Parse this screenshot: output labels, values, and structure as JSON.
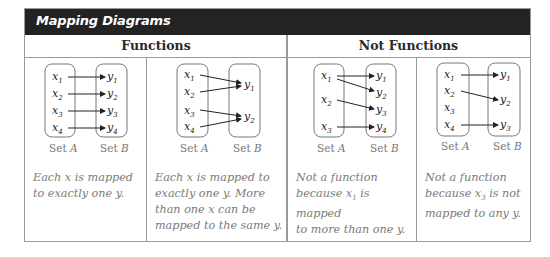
{
  "title": "Mapping Diagrams",
  "groups": [
    {
      "label": "Functions"
    },
    {
      "label": "Not Functions"
    }
  ],
  "set_labels": {
    "a": "Set A",
    "b": "Set B"
  },
  "diagrams": [
    {
      "domain": [
        "x1",
        "x2",
        "x3",
        "x4"
      ],
      "range": [
        "y1",
        "y2",
        "y3",
        "y4"
      ],
      "mappings": [
        [
          "x1",
          "y1"
        ],
        [
          "x2",
          "y2"
        ],
        [
          "x3",
          "y3"
        ],
        [
          "x4",
          "y4"
        ]
      ],
      "caption": "Each x is mapped to exactly one y."
    },
    {
      "domain": [
        "x1",
        "x2",
        "x3",
        "x4"
      ],
      "range": [
        "y1",
        "y2"
      ],
      "mappings": [
        [
          "x1",
          "y1"
        ],
        [
          "x2",
          "y1"
        ],
        [
          "x3",
          "y2"
        ],
        [
          "x4",
          "y2"
        ]
      ],
      "caption": "Each x is mapped to exactly one y. More than one x can be mapped to the same y."
    },
    {
      "domain": [
        "x1",
        "x2",
        "x3"
      ],
      "range": [
        "y1",
        "y2",
        "y3",
        "y4"
      ],
      "mappings": [
        [
          "x1",
          "y1"
        ],
        [
          "x1",
          "y2"
        ],
        [
          "x2",
          "y3"
        ],
        [
          "x3",
          "y4"
        ]
      ],
      "caption": "Not a function because x1 is mapped to more than one y."
    },
    {
      "domain": [
        "x1",
        "x2",
        "x3",
        "x4"
      ],
      "range": [
        "y1",
        "y2",
        "y3"
      ],
      "mappings": [
        [
          "x1",
          "y1"
        ],
        [
          "x2",
          "y2"
        ],
        [
          "x4",
          "y3"
        ]
      ],
      "caption": "Not a function because x3 is not mapped to any y."
    }
  ],
  "captions_display": [
    {
      "lines": [
        "Each x is mapped",
        "to exactly one y."
      ]
    },
    {
      "lines": [
        "Each x is mapped to",
        "exactly one y. More",
        "than one x can be",
        "mapped to the same y."
      ]
    },
    {
      "pre": "Not a function",
      "l2a": "because x",
      "l2sub": "1",
      "l2b": " is mapped",
      "l3": "to more than one y."
    },
    {
      "pre": "Not a function",
      "l2a": "because x",
      "l2sub": "3",
      "l2b": " is not",
      "l3": "mapped to any y."
    }
  ],
  "colors": {
    "header_bg": "#232323",
    "border": "#9a9a9a",
    "caption": "#7a7a7a",
    "set_box": "#777777"
  }
}
